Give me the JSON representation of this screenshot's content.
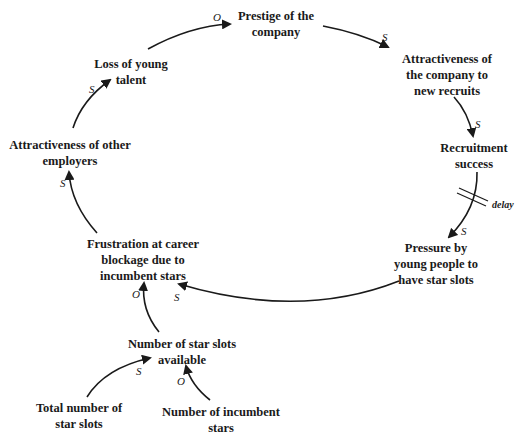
{
  "diagram": {
    "type": "causal-loop-diagram",
    "nodes": {
      "prestige": {
        "lines": [
          "Prestige of the",
          "company"
        ]
      },
      "attract_company": {
        "lines": [
          "Attractiveness of",
          "the company to",
          "new recruits"
        ]
      },
      "recruitment": {
        "lines": [
          "Recruitment",
          "success"
        ]
      },
      "pressure": {
        "lines": [
          "Pressure by",
          "young people to",
          "have star slots"
        ]
      },
      "frustration": {
        "lines": [
          "Frustration at career",
          "blockage due to",
          "incumbent stars"
        ]
      },
      "attract_other": {
        "lines": [
          "Attractiveness of other",
          "employers"
        ]
      },
      "loss": {
        "lines": [
          "Loss of young",
          "talent"
        ]
      },
      "slots_available": {
        "lines": [
          "Number of star slots",
          "available"
        ]
      },
      "total_slots": {
        "lines": [
          "Total number of",
          "star slots"
        ]
      },
      "incumbent": {
        "lines": [
          "Number of incumbent",
          "stars"
        ]
      }
    },
    "links": [
      {
        "from": "Loss of young talent",
        "to": "Prestige of the company",
        "polarity": "O"
      },
      {
        "from": "Prestige of the company",
        "to": "Attractiveness of the company to new recruits",
        "polarity": "S"
      },
      {
        "from": "Attractiveness of the company to new recruits",
        "to": "Recruitment success",
        "polarity": "S"
      },
      {
        "from": "Recruitment success",
        "to": "Pressure by young people to have star slots",
        "polarity": "S",
        "delay": true
      },
      {
        "from": "Pressure by young people to have star slots",
        "to": "Frustration at career blockage due to incumbent stars",
        "polarity": "S"
      },
      {
        "from": "Frustration at career blockage due to incumbent stars",
        "to": "Attractiveness of other employers",
        "polarity": "S"
      },
      {
        "from": "Attractiveness of other employers",
        "to": "Loss of young talent",
        "polarity": "S"
      },
      {
        "from": "Number of star slots available",
        "to": "Frustration at career blockage due to incumbent stars",
        "polarity": "O"
      },
      {
        "from": "Total number of star slots",
        "to": "Number of star slots available",
        "polarity": "S"
      },
      {
        "from": "Number of incumbent stars",
        "to": "Number of star slots available",
        "polarity": "O"
      }
    ],
    "polarity_labels": {
      "loss_prestige": "O",
      "prestige_attract": "S",
      "attract_recruit": "S",
      "recruit_pressure": "S",
      "pressure_frustration": "S",
      "frustration_other": "S",
      "other_loss": "S",
      "slots_frustration": "O",
      "total_slots": "S",
      "incumbent_slots": "O"
    },
    "delay_label": "delay",
    "colors": {
      "ink": "#1a1a1a",
      "background": "#ffffff"
    }
  }
}
